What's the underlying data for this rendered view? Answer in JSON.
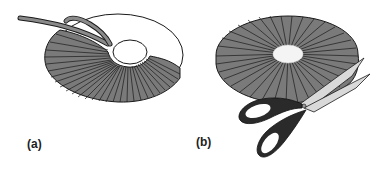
{
  "figure": {
    "panels": [
      {
        "id": "a",
        "label": "(a)",
        "subject": "yarn being wrapped around a cardboard ring",
        "elements": [
          "cardboard-ring",
          "wrapped-yarn",
          "yarn-strand"
        ]
      },
      {
        "id": "b",
        "label": "(b)",
        "subject": "scissors cutting the wrapped yarn around the outer edge",
        "elements": [
          "fully-wrapped-ring",
          "scissors"
        ]
      }
    ]
  },
  "colors": {
    "yarn_fill": "#7a7a7a",
    "yarn_lines": "#1a1a1a",
    "ring_outline": "#1a1a1a",
    "scissors_handle": "#2a2a2a",
    "blade": "#d9d9d9",
    "background": "#ffffff"
  }
}
